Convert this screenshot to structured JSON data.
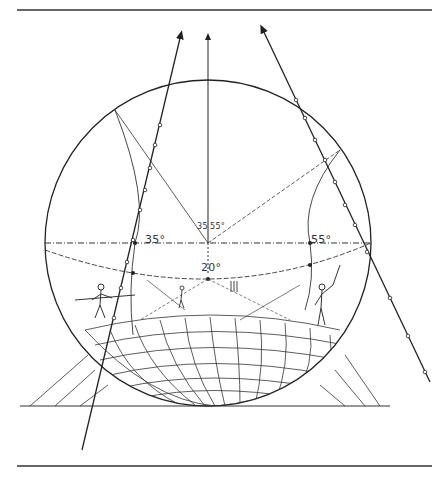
{
  "figure": {
    "type": "curvilinear perspective diagram",
    "angle_labels": {
      "left": "35°",
      "right": "55°",
      "below_center": "20°",
      "apex_left": "35",
      "apex_right": "55°"
    },
    "colors": {
      "ink": "#222222",
      "paper": "#ffffff"
    },
    "circle": {
      "cx": 208,
      "cy": 243,
      "r": 163
    },
    "rules": {
      "top_y": 10,
      "bottom_y": 465,
      "ground_y": 406
    }
  }
}
